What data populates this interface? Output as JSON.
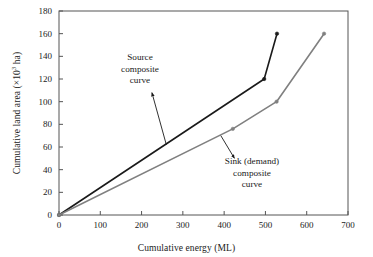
{
  "chart_data": {
    "type": "line",
    "title": "",
    "xlabel": "Cumulative energy (ML)",
    "ylabel_text": "Cumulative land area (×10",
    "ylabel_sup": "3",
    "ylabel_tail": " ha)",
    "xlim": [
      0,
      700
    ],
    "ylim": [
      0,
      180
    ],
    "xticks": [
      0,
      100,
      200,
      300,
      400,
      500,
      600,
      700
    ],
    "yticks": [
      0,
      20,
      40,
      60,
      80,
      100,
      120,
      140,
      160,
      180
    ],
    "grid": false,
    "legend": "none",
    "series": [
      {
        "name": "Source composite curve",
        "color": "#1a1a1a",
        "x": [
          0,
          497,
          528
        ],
        "y": [
          0,
          120,
          160
        ]
      },
      {
        "name": "Sink (demand) composite curve",
        "color": "#808080",
        "x": [
          0,
          421,
          527,
          642
        ],
        "y": [
          0,
          76,
          100,
          160
        ]
      }
    ],
    "annotations": [
      {
        "name": "source-annotation",
        "lines": [
          "Source",
          "composite",
          "curve"
        ],
        "arrow_from": [
          225,
          108
        ],
        "arrow_to": [
          260,
          62
        ]
      },
      {
        "name": "sink-annotation",
        "lines": [
          "Sink (demand)",
          "composite",
          "curve"
        ],
        "arrow_from": [
          425,
          50
        ],
        "arrow_to": [
          392,
          70
        ]
      }
    ]
  },
  "axes": {
    "x_title": "Cumulative energy (ML)",
    "y_title_prefix": "Cumulative land area (×10",
    "y_title_exp": "3",
    "y_title_suffix": " ha)"
  },
  "ticks": {
    "x": [
      "0",
      "100",
      "200",
      "300",
      "400",
      "500",
      "600",
      "700"
    ],
    "y": [
      "0",
      "20",
      "40",
      "60",
      "80",
      "100",
      "120",
      "140",
      "160",
      "180"
    ]
  },
  "annotations": {
    "source": {
      "l1": "Source",
      "l2": "composite",
      "l3": "curve"
    },
    "sink": {
      "l1": "Sink (demand)",
      "l2": "composite",
      "l3": "curve"
    }
  },
  "colors": {
    "source_curve": "#1a1a1a",
    "sink_curve": "#808080",
    "axis": "#555555",
    "background": "#ffffff"
  }
}
